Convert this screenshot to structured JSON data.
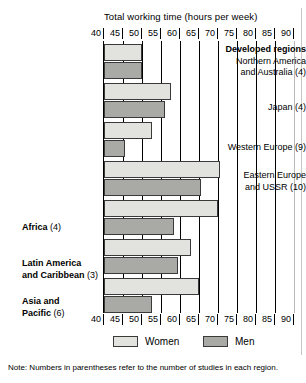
{
  "chart_data": {
    "type": "bar",
    "orientation": "horizontal",
    "title": "Total working time (hours per week)",
    "xlabel": "Total working time (hours per week)",
    "ylabel": "",
    "xlim": [
      40,
      90
    ],
    "xticks": [
      40,
      45,
      50,
      55,
      60,
      65,
      70,
      75,
      80,
      85,
      90
    ],
    "grid": true,
    "legend_position": "bottom",
    "group_header": "Developed regions",
    "categories": [
      "Northern America and Australia (4)",
      "Japan (4)",
      "Western Europe (9)",
      "Eastern Europe and USSR (10)",
      "Africa (4)",
      "Latin America and Caribbean (3)",
      "Asia and Pacific (6)"
    ],
    "series": [
      {
        "name": "Women",
        "values": [
          50,
          57.5,
          52.5,
          70.5,
          70,
          63,
          65
        ]
      },
      {
        "name": "Men",
        "values": [
          50,
          56,
          45.5,
          65.5,
          58.5,
          59.5,
          52.5
        ]
      }
    ],
    "note": "Note:  Numbers in parentheses refer to the number of studies in each region."
  },
  "axis": {
    "ticks": [
      "40",
      "45",
      "50",
      "55",
      "60",
      "65",
      "70",
      "75",
      "80",
      "85",
      "90"
    ]
  },
  "labels": {
    "developed_regions": "Developed regions",
    "northern_america_l1": "Northern America",
    "northern_america_l2": "and Australia (4)",
    "japan": "Japan (4)",
    "western_europe": "Western Europe (9)",
    "eastern_europe_l1": "Eastern Europe",
    "eastern_europe_l2": "and USSR (10)",
    "africa_bold": "Africa",
    "africa_count": " (4)",
    "latin_l1": "Latin America",
    "latin_l2_bold": "and Caribbean",
    "latin_l2_count": " (3)",
    "asia_l1": "Asia and",
    "asia_l2_bold": "Pacific",
    "asia_l2_count": " (6)"
  },
  "legend": {
    "women": "Women",
    "men": "Men"
  },
  "note": {
    "prefix": "Note:",
    "text": "  Numbers in parentheses refer to the number of studies in each region."
  },
  "colors": {
    "women": "#e2e2de",
    "men": "#a9a9a5",
    "outline": "#3a3a3a",
    "axis": "#000000"
  }
}
